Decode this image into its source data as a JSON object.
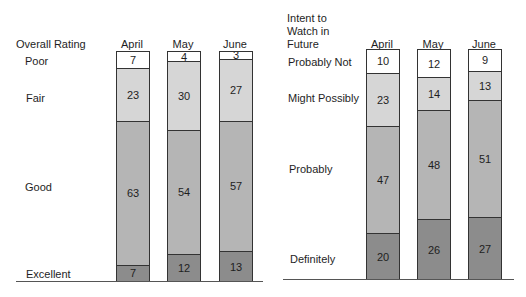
{
  "colors": {
    "white": "#ffffff",
    "light": "#d6d6d6",
    "medium": "#b5b5b5",
    "dark": "#8c8c8c"
  },
  "left": {
    "title": "Overall Rating",
    "months": [
      "April",
      "May",
      "June"
    ],
    "categories": [
      "Poor",
      "Fair",
      "Good",
      "Excellent"
    ]
  },
  "right": {
    "title_lines": [
      "Intent to",
      "Watch in",
      "Future"
    ],
    "months": [
      "April",
      "May",
      "June"
    ],
    "categories": [
      "Probably Not",
      "Might Possibly",
      "Probably",
      "Definitely"
    ]
  },
  "chart_data": [
    {
      "type": "bar",
      "stacked": true,
      "title": "Overall Rating",
      "categories": [
        "April",
        "May",
        "June"
      ],
      "series": [
        {
          "name": "Poor",
          "values": [
            7,
            4,
            3
          ],
          "color": "#ffffff"
        },
        {
          "name": "Fair",
          "values": [
            23,
            30,
            27
          ],
          "color": "#d6d6d6"
        },
        {
          "name": "Good",
          "values": [
            63,
            54,
            57
          ],
          "color": "#b5b5b5"
        },
        {
          "name": "Excellent",
          "values": [
            7,
            12,
            13
          ],
          "color": "#8c8c8c"
        }
      ],
      "xlabel": "",
      "ylabel": "",
      "ylim": [
        0,
        100
      ],
      "grid": false,
      "legend": "left labels",
      "units": "percent"
    },
    {
      "type": "bar",
      "stacked": true,
      "title": "Intent to Watch in Future",
      "categories": [
        "April",
        "May",
        "June"
      ],
      "series": [
        {
          "name": "Probably Not",
          "values": [
            10,
            12,
            9
          ],
          "color": "#ffffff"
        },
        {
          "name": "Might Possibly",
          "values": [
            23,
            14,
            13
          ],
          "color": "#d6d6d6"
        },
        {
          "name": "Probably",
          "values": [
            47,
            48,
            51
          ],
          "color": "#b5b5b5"
        },
        {
          "name": "Definitely",
          "values": [
            20,
            26,
            27
          ],
          "color": "#8c8c8c"
        }
      ],
      "xlabel": "",
      "ylabel": "",
      "ylim": [
        0,
        100
      ],
      "grid": false,
      "legend": "left labels",
      "units": "percent"
    }
  ]
}
